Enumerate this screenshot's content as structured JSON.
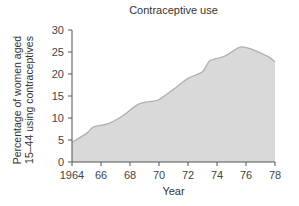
{
  "chart_data": {
    "type": "area",
    "title": "Contraceptive use",
    "xlabel": "Year",
    "ylabel_line1": "Percentage of women aged",
    "ylabel_line2": "15–44 using contraceptives",
    "x": [
      1964,
      1965,
      1965.5,
      1966.5,
      1967.5,
      1968.5,
      1969.5,
      1970,
      1971,
      1972,
      1973,
      1973.5,
      1974.5,
      1975.5,
      1976,
      1976.5,
      1977.5,
      1978
    ],
    "values": [
      4.5,
      6.5,
      8.0,
      8.7,
      10.5,
      13.0,
      13.8,
      14.2,
      16.5,
      19.0,
      20.5,
      23.0,
      24.0,
      26.0,
      26.0,
      25.5,
      24.0,
      22.8
    ],
    "xlim": [
      1964,
      1978
    ],
    "ylim": [
      0,
      30
    ],
    "x_ticks": [
      1964,
      1966,
      1968,
      1970,
      1972,
      1974,
      1976,
      1978
    ],
    "x_tick_labels": [
      "1964",
      "66",
      "68",
      "70",
      "72",
      "74",
      "76",
      "78"
    ],
    "y_ticks": [
      0,
      5,
      10,
      15,
      20,
      25,
      30
    ],
    "grid": false,
    "legend": null,
    "fill_color": "#d9d9d9",
    "line_color": "#b0b0b0"
  }
}
